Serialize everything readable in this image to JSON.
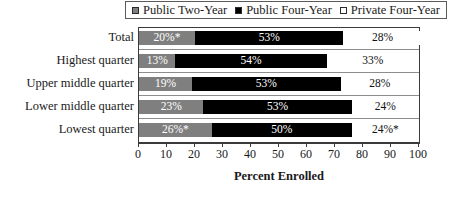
{
  "chart_data": {
    "type": "bar",
    "subtype": "stacked-horizontal",
    "title": "",
    "xlabel": "Percent Enrolled",
    "ylabel": "",
    "xlim": [
      0,
      100
    ],
    "xticks": [
      0,
      10,
      20,
      30,
      40,
      50,
      60,
      70,
      80,
      90,
      100
    ],
    "grid": false,
    "legend_position": "top",
    "categories": [
      "Total",
      "Highest quarter",
      "Upper middle quarter",
      "Lower middle quarter",
      "Lowest quarter"
    ],
    "series": [
      {
        "name": "Public Two-Year",
        "color": "#7f7f7f",
        "values": [
          20,
          13,
          19,
          23,
          26
        ],
        "labels": [
          "20%*",
          "13%",
          "19%",
          "23%",
          "26%*"
        ]
      },
      {
        "name": "Public Four-Year",
        "color": "#000000",
        "values": [
          53,
          54,
          53,
          53,
          50
        ],
        "labels": [
          "53%",
          "54%",
          "53%",
          "53%",
          "50%"
        ]
      },
      {
        "name": "Private Four-Year",
        "color": "#ffffff",
        "values": [
          28,
          33,
          28,
          24,
          24
        ],
        "labels": [
          "28%",
          "33%",
          "28%",
          "24%",
          "24%*"
        ]
      }
    ]
  },
  "legend": {
    "items": [
      {
        "label": "Public Two-Year",
        "swatch": "gray"
      },
      {
        "label": "Public Four-Year",
        "swatch": "black"
      },
      {
        "label": "Private Four-Year",
        "swatch": "white"
      }
    ]
  },
  "axis": {
    "title": "Percent Enrolled",
    "ticks": [
      "0",
      "10",
      "20",
      "30",
      "40",
      "50",
      "60",
      "70",
      "80",
      "90",
      "100"
    ]
  }
}
